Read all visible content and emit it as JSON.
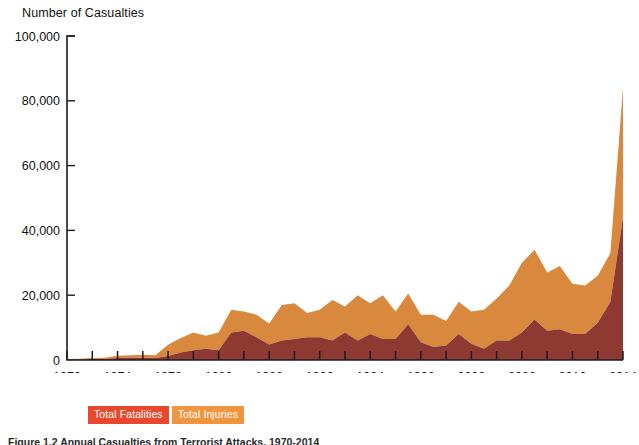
{
  "chart_data": {
    "type": "area",
    "stacked": true,
    "title": "Number of Casualties",
    "xlabel": "",
    "ylabel": "Number of Casualties",
    "ylim": [
      0,
      100000
    ],
    "xlim": [
      1970,
      2014
    ],
    "grid": false,
    "legend_position": "bottom-left",
    "ytick_labels": [
      "0",
      "20,000",
      "40,000",
      "60,000",
      "80,000",
      "100,000"
    ],
    "ytick_values": [
      0,
      20000,
      40000,
      60000,
      80000,
      100000
    ],
    "xtick_labels": [
      "1970",
      "1974",
      "1978",
      "1982",
      "1986",
      "1990",
      "1994",
      "1998",
      "2002",
      "2006",
      "2010",
      "2014"
    ],
    "xtick_values": [
      1970,
      1974,
      1978,
      1982,
      1986,
      1990,
      1994,
      1998,
      2002,
      2006,
      2010,
      2014
    ],
    "x": [
      1970,
      1971,
      1972,
      1973,
      1974,
      1975,
      1976,
      1977,
      1978,
      1979,
      1980,
      1981,
      1982,
      1983,
      1984,
      1985,
      1986,
      1987,
      1988,
      1989,
      1990,
      1991,
      1992,
      1993,
      1994,
      1995,
      1996,
      1997,
      1998,
      1999,
      2000,
      2001,
      2002,
      2003,
      2004,
      2005,
      2006,
      2007,
      2008,
      2009,
      2010,
      2011,
      2012,
      2013,
      2014
    ],
    "series": [
      {
        "name": "Total Fatalities",
        "color": "#8e3a33",
        "values": [
          200,
          200,
          300,
          300,
          600,
          700,
          700,
          600,
          1200,
          2300,
          3000,
          3500,
          3000,
          8500,
          9000,
          7000,
          4800,
          6000,
          6500,
          7000,
          7000,
          6000,
          8500,
          6000,
          8000,
          6500,
          6500,
          11000,
          5500,
          4000,
          4500,
          8000,
          5000,
          3500,
          6000,
          6000,
          8500,
          12500,
          9000,
          9500,
          8000,
          8000,
          11500,
          18000,
          44000
        ]
      },
      {
        "name": "Total Injuries",
        "color": "#d8893e",
        "values": [
          100,
          200,
          300,
          400,
          700,
          800,
          900,
          900,
          3500,
          4500,
          5500,
          4000,
          5500,
          7000,
          6000,
          7000,
          6500,
          11000,
          11000,
          7500,
          8500,
          12500,
          8000,
          14000,
          9500,
          13500,
          8500,
          9500,
          8500,
          10000,
          7500,
          10000,
          10000,
          12000,
          13000,
          17000,
          21500,
          21500,
          18000,
          19500,
          15500,
          15000,
          14500,
          15000,
          40000
        ]
      }
    ],
    "annotations": [
      {
        "label": "2014 peak total casualties",
        "x": 2014,
        "y": 84000
      },
      {
        "label": "2007 peak total casualties",
        "x": 2007,
        "y": 34000
      },
      {
        "label": "1997 local peak total casualties",
        "x": 1997,
        "y": 20500
      }
    ]
  },
  "header": {
    "title": "Number of Casualties"
  },
  "legend": {
    "items": [
      {
        "label": "Total Fatalities",
        "color": "#e8492e"
      },
      {
        "label": "Total Injuries",
        "color": "#f0953e"
      }
    ]
  },
  "caption": {
    "text": "Figure 1.2  Annual Casualties from Terrorist Attacks, 1970-2014"
  }
}
